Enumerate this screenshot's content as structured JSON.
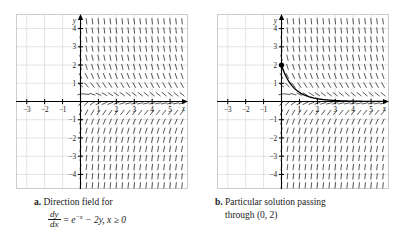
{
  "figure": {
    "panels": [
      {
        "id": "a",
        "marker": "a.",
        "caption_line1": "Direction field for",
        "equation": {
          "fraction_numerator": "dy",
          "fraction_denominator": "dx",
          "equals": "=",
          "base": "e",
          "exponent": "−x",
          "rest": "− 2y, x ≥ 0"
        },
        "has_solution_curve": false
      },
      {
        "id": "b",
        "marker": "b.",
        "caption_line1": "Particular solution passing",
        "caption_line2": "through (0, 2)",
        "has_solution_curve": true
      }
    ]
  },
  "chart_data": {
    "type": "line",
    "xlabel": "x",
    "ylabel": "y",
    "xlim": [
      -3.6,
      6.0
    ],
    "ylim": [
      -4.8,
      4.8
    ],
    "grid": true,
    "grid_spacing": 1,
    "x_ticks": [
      -3,
      -2,
      -1,
      1,
      2,
      3,
      4,
      5
    ],
    "x_tick_labels": [
      "−3",
      "−2",
      "−1",
      "1",
      "2",
      "3",
      "4",
      "5"
    ],
    "y_ticks": [
      -4,
      -3,
      -2,
      -1,
      1,
      2,
      3,
      4
    ],
    "y_tick_labels": [
      "−4",
      "−3",
      "−2",
      "−1",
      "1",
      "2",
      "3",
      "4"
    ],
    "axis_label_x": "x",
    "axis_label_y": "y",
    "slope_field": {
      "equation": "dy/dx = exp(-x) - 2y",
      "domain_x": [
        0,
        5.7
      ],
      "domain_y": [
        -4.6,
        4.6
      ],
      "x_step": 0.3333,
      "y_step": 0.5,
      "tick_length": 0.34,
      "color": "#3a3a3a"
    },
    "solution_curve": {
      "expression": "y = exp(-x) + exp(-2x)",
      "initial_point": [
        0,
        2
      ],
      "point_marker": "filled-circle",
      "x_range": [
        0,
        5.7
      ],
      "color": "#000000",
      "sampled_points": [
        [
          0.0,
          2.0
        ],
        [
          0.2,
          1.489
        ],
        [
          0.4,
          1.119
        ],
        [
          0.6,
          0.85
        ],
        [
          0.8,
          0.651
        ],
        [
          1.0,
          0.503
        ],
        [
          1.2,
          0.392
        ],
        [
          1.4,
          0.307
        ],
        [
          1.6,
          0.242
        ],
        [
          1.8,
          0.192
        ],
        [
          2.0,
          0.153
        ],
        [
          2.5,
          0.089
        ],
        [
          3.0,
          0.052
        ],
        [
          3.5,
          0.031
        ],
        [
          4.0,
          0.018
        ],
        [
          4.5,
          0.011
        ],
        [
          5.0,
          0.007
        ],
        [
          5.7,
          0.003
        ]
      ]
    },
    "colors": {
      "grid": "#d9d9d9",
      "frame": "#c2c2c2",
      "axis": "#000000",
      "slope_mark": "#3a3a3a",
      "curve": "#000000"
    }
  }
}
